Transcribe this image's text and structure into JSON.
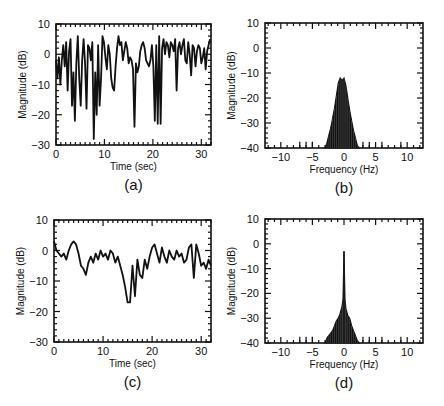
{
  "chart_data": [
    {
      "id": "a",
      "type": "line",
      "panel_label": "(a)",
      "title": "",
      "xlabel": "Time (sec)",
      "ylabel": "Magnitude (dB)",
      "xlim": [
        0,
        32
      ],
      "ylim": [
        -30,
        10
      ],
      "xticks": [
        0,
        10,
        20,
        30
      ],
      "yticks": [
        10,
        0,
        -10,
        -20,
        -30
      ],
      "grid": false,
      "frame": {
        "left": 56,
        "top": 24,
        "right": 211,
        "bottom": 145
      },
      "x": [
        0,
        0.3,
        0.6,
        0.9,
        1.2,
        1.5,
        1.8,
        2.1,
        2.4,
        2.7,
        3.0,
        3.3,
        3.6,
        3.9,
        4.2,
        4.5,
        4.8,
        5.1,
        5.4,
        5.7,
        6.0,
        6.3,
        6.6,
        6.9,
        7.2,
        7.5,
        7.8,
        8.1,
        8.4,
        8.7,
        9.0,
        9.3,
        9.6,
        9.9,
        10.2,
        10.5,
        10.8,
        11.1,
        11.4,
        11.7,
        12.0,
        12.3,
        12.6,
        12.9,
        13.2,
        13.5,
        13.8,
        14.1,
        14.4,
        14.7,
        15.0,
        15.3,
        15.6,
        15.9,
        16.2,
        16.5,
        16.8,
        17.1,
        17.4,
        17.7,
        18.0,
        18.3,
        18.6,
        18.9,
        19.2,
        19.5,
        19.8,
        20.1,
        20.4,
        20.7,
        21.0,
        21.3,
        21.6,
        21.9,
        22.2,
        22.5,
        22.8,
        23.1,
        23.4,
        23.7,
        24.0,
        24.3,
        24.6,
        24.9,
        25.2,
        25.5,
        25.8,
        26.1,
        26.4,
        26.7,
        27.0,
        27.3,
        27.6,
        27.9,
        28.2,
        28.5,
        28.8,
        29.1,
        29.4,
        29.7,
        30.0,
        30.3,
        30.6,
        30.9,
        31.2,
        31.5,
        31.8
      ],
      "values": [
        -2,
        -8,
        -1,
        -10,
        -2,
        3,
        -4,
        4,
        -12,
        1,
        5,
        -17,
        -6,
        -22,
        -3,
        6,
        -8,
        -17,
        -2,
        5,
        -3,
        -18,
        3,
        2,
        -2,
        4,
        -28,
        -6,
        -20,
        3,
        -17,
        -8,
        6,
        4,
        -1,
        -5,
        3,
        0,
        -8,
        -11,
        -12,
        -4,
        2,
        6,
        3,
        4,
        -2,
        1,
        4,
        2,
        -3,
        -1,
        -2,
        -5,
        -24,
        -3,
        -6,
        -4,
        1,
        3,
        4,
        2,
        -2,
        -3,
        -4,
        -2,
        3,
        -4,
        -22,
        3,
        -23,
        6,
        -23,
        2,
        5,
        0,
        4,
        3,
        -1,
        4,
        3,
        1,
        5,
        -12,
        2,
        4,
        0,
        3,
        5,
        -2,
        -3,
        4,
        0,
        -7,
        3,
        2,
        -4,
        1,
        3,
        2,
        -3,
        -1,
        2,
        -5,
        1,
        3,
        5
      ],
      "series_color": "#111111"
    },
    {
      "id": "b",
      "type": "line",
      "panel_label": "(b)",
      "title": "",
      "xlabel": "Frequency (Hz)",
      "ylabel": "Magnitude (dB)",
      "xlim": [
        -12.5,
        12.5
      ],
      "ylim": [
        -40,
        10
      ],
      "xticks": [
        -10,
        -5,
        0,
        5,
        10
      ],
      "yticks": [
        10,
        0,
        -10,
        -20,
        -30,
        -40
      ],
      "grid": false,
      "frame": {
        "left": 265,
        "top": 23,
        "right": 423,
        "bottom": 148
      },
      "x": [
        -3.0,
        -2.7,
        -2.4,
        -2.1,
        -1.8,
        -1.5,
        -1.2,
        -0.9,
        -0.6,
        -0.3,
        0.0,
        0.3,
        0.6,
        0.9,
        1.2,
        1.5,
        1.8,
        2.1,
        2.4
      ],
      "values": [
        -40,
        -38,
        -35,
        -32,
        -28,
        -24,
        -19,
        -14,
        -12,
        -13,
        -12,
        -15,
        -20,
        -25,
        -29,
        -33,
        -36,
        -39,
        -40
      ],
      "series_color": "#111111"
    },
    {
      "id": "c",
      "type": "line",
      "panel_label": "(c)",
      "title": "",
      "xlabel": "Time (sec)",
      "ylabel": "Magnitude (dB)",
      "xlim": [
        0,
        32
      ],
      "ylim": [
        -30,
        10
      ],
      "xticks": [
        0,
        10,
        20,
        30
      ],
      "yticks": [
        10,
        0,
        -10,
        -20,
        -30
      ],
      "grid": false,
      "frame": {
        "left": 54,
        "top": 220,
        "right": 211,
        "bottom": 342
      },
      "x": [
        0,
        0.5,
        1.0,
        1.5,
        2.0,
        2.5,
        3.0,
        3.5,
        4.0,
        4.5,
        5.0,
        5.5,
        6.0,
        6.5,
        7.0,
        7.5,
        8.0,
        8.5,
        9.0,
        9.5,
        10.0,
        10.5,
        11.0,
        11.5,
        12.0,
        12.5,
        13.0,
        13.5,
        14.0,
        14.5,
        15.0,
        15.5,
        16.0,
        16.5,
        17.0,
        17.5,
        18.0,
        18.5,
        19.0,
        19.5,
        20.0,
        20.5,
        21.0,
        21.5,
        22.0,
        22.5,
        23.0,
        23.5,
        24.0,
        24.5,
        25.0,
        25.5,
        26.0,
        26.5,
        27.0,
        27.5,
        28.0,
        28.5,
        29.0,
        29.5,
        30.0,
        30.5,
        31.0,
        31.5,
        32.0
      ],
      "values": [
        3,
        0,
        -1,
        -2,
        -1,
        -3,
        0,
        2,
        3,
        2,
        -1,
        -5,
        -6,
        -8,
        -4,
        -2,
        -4,
        -1,
        -3,
        0,
        -2,
        -1,
        -3,
        0,
        -1,
        -4,
        -2,
        -5,
        -8,
        -12,
        -17,
        -17,
        -5,
        -15,
        -3,
        -8,
        -9,
        -3,
        -6,
        -2,
        1,
        2,
        -1,
        -4,
        1,
        -2,
        -4,
        0,
        -2,
        -3,
        0,
        -2,
        -1,
        -4,
        -3,
        1,
        2,
        -9,
        2,
        -1,
        -5,
        -4,
        -6,
        -3,
        -5
      ],
      "series_color": "#111111"
    },
    {
      "id": "d",
      "type": "line",
      "panel_label": "(d)",
      "title": "",
      "xlabel": "Frequency (Hz)",
      "ylabel": "Magnitude (dB)",
      "xlim": [
        -12.5,
        12.5
      ],
      "ylim": [
        -40,
        10
      ],
      "xticks": [
        -10,
        -5,
        0,
        5,
        10
      ],
      "yticks": [
        10,
        0,
        -10,
        -20,
        -30,
        -40
      ],
      "grid": false,
      "frame": {
        "left": 265,
        "top": 219,
        "right": 423,
        "bottom": 343
      },
      "x": [
        -3.0,
        -2.7,
        -2.4,
        -2.1,
        -1.8,
        -1.5,
        -1.2,
        -0.9,
        -0.6,
        -0.3,
        -0.15,
        0.0,
        0.15,
        0.3,
        0.6,
        0.9,
        1.2,
        1.5,
        1.8,
        2.1,
        2.4
      ],
      "values": [
        -40,
        -38,
        -37,
        -36,
        -35,
        -33,
        -31,
        -30,
        -28,
        -25,
        -22,
        -3,
        -22,
        -26,
        -29,
        -30,
        -33,
        -35,
        -37,
        -39,
        -40
      ],
      "series_color": "#111111"
    }
  ],
  "panels": {
    "a": {
      "label": "(a)",
      "xlabel": "Time (sec)",
      "ylabel": "Magnitude (dB)",
      "yticks": [
        "10",
        "0",
        "-10",
        "-20",
        "-30"
      ],
      "xticks": [
        "0",
        "10",
        "20",
        "30"
      ]
    },
    "b": {
      "label": "(b)",
      "xlabel": "Frequency (Hz)",
      "ylabel": "Magnitude (dB)",
      "yticks": [
        "10",
        "0",
        "-10",
        "-20",
        "-30",
        "-40"
      ],
      "xticks": [
        "-10",
        "-5",
        "0",
        "5",
        "10"
      ]
    },
    "c": {
      "label": "(c)",
      "xlabel": "Time (sec)",
      "ylabel": "Magnitude (dB)",
      "yticks": [
        "10",
        "0",
        "-10",
        "-20",
        "-30"
      ],
      "xticks": [
        "0",
        "10",
        "20",
        "30"
      ]
    },
    "d": {
      "label": "(d)",
      "xlabel": "Frequency (Hz)",
      "ylabel": "Magnitude (dB)",
      "yticks": [
        "10",
        "0",
        "-10",
        "-20",
        "-30",
        "-40"
      ],
      "xticks": [
        "-10",
        "-5",
        "0",
        "5",
        "10"
      ]
    }
  }
}
